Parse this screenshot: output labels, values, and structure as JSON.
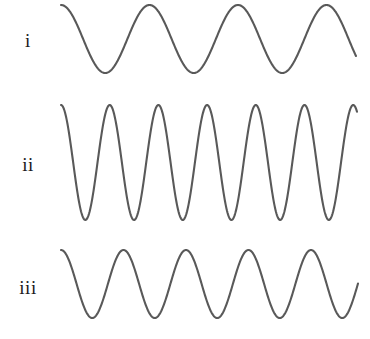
{
  "figure": {
    "background_color": "#ffffff",
    "stroke_color": "#595959",
    "width": 370,
    "height": 339
  },
  "rows": [
    {
      "label": "i",
      "label_x": 28,
      "label_y": 41,
      "wave": {
        "x_start": 61,
        "x_end": 356,
        "y_top": 5,
        "y_bottom": 73,
        "amplitude": 34,
        "baseline": 39,
        "period": 88.5,
        "phase_deg": 90,
        "cycles": 3.33
      }
    },
    {
      "label": "ii",
      "label_x": 28,
      "label_y": 165,
      "wave": {
        "x_start": 61,
        "x_end": 357,
        "y_top": 105,
        "y_bottom": 220,
        "amplitude": 57.5,
        "baseline": 162.5,
        "period": 48.7,
        "phase_deg": 90,
        "cycles": 6.08
      }
    },
    {
      "label": "iii",
      "label_x": 28,
      "label_y": 288,
      "wave": {
        "x_start": 61,
        "x_end": 358,
        "y_top": 250,
        "y_bottom": 318,
        "amplitude": 34,
        "baseline": 284,
        "period": 62.5,
        "phase_deg": 90,
        "cycles": 4.75
      }
    }
  ],
  "chart_data": {
    "type": "line",
    "title": "",
    "xlabel": "",
    "ylabel": "",
    "grid": false,
    "legend": "none",
    "series": [
      {
        "name": "i",
        "waveform": "sine",
        "amplitude_px": 34,
        "wavelength_px": 88.5,
        "cycles_shown": 3.33,
        "peaks_x": [
          62,
          152,
          240,
          328
        ],
        "troughs_x": [
          106,
          196,
          284
        ],
        "peak_y": 5,
        "trough_y": 73
      },
      {
        "name": "ii",
        "waveform": "sine",
        "amplitude_px": 57.5,
        "wavelength_px": 48.7,
        "cycles_shown": 6.08,
        "peaks_x": [
          62,
          110,
          158,
          207,
          256,
          305
        ],
        "troughs_x": [
          86,
          134,
          183,
          232,
          280,
          329
        ],
        "peak_y": 105,
        "trough_y": 220
      },
      {
        "name": "iii",
        "waveform": "sine",
        "amplitude_px": 34,
        "wavelength_px": 62.5,
        "cycles_shown": 4.75,
        "peaks_x": [
          62,
          124,
          188,
          250,
          313
        ],
        "troughs_x": [
          93,
          156,
          219,
          281,
          344
        ],
        "peak_y": 250,
        "trough_y": 318
      }
    ]
  }
}
